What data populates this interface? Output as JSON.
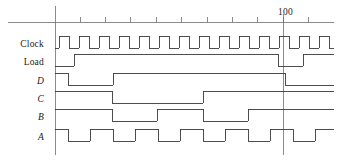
{
  "figure": {
    "kind": "digital-timing-diagram",
    "width": 338,
    "height": 161,
    "background": "#ffffff",
    "line_color": "#3a3a3a",
    "axis_color": "#6e6e6e",
    "text_color": "#1a1a1a"
  },
  "axis": {
    "baseline_y": 22,
    "origin_x": 55,
    "vertical_axis_top": 6,
    "vertical_axis_bottom": 155,
    "axis_start_x": 8,
    "axis_end_x": 334,
    "tick_spacing": 25.4,
    "tick_height": 5,
    "tick_start_x": 80,
    "tick_count": 10
  },
  "markers": [
    {
      "name": "time-marker-100",
      "label": "100",
      "x": 283,
      "label_x": 278,
      "label_y": 8,
      "top_y": 14,
      "bottom_y": 155
    }
  ],
  "signals": [
    {
      "name": "clock",
      "label": "Clock",
      "italic": false,
      "label_x": 44,
      "label_y": 40,
      "low_y": 48,
      "high_y": 36,
      "start_x": 55,
      "end_x": 334,
      "initial": 0,
      "transitions": [
        59,
        69,
        79,
        89,
        99,
        109,
        119,
        129,
        139,
        149,
        159,
        169,
        179,
        189,
        199,
        209,
        219,
        229,
        239,
        249,
        259,
        269,
        279,
        289,
        299,
        309,
        319,
        329
      ]
    },
    {
      "name": "load",
      "label": "Load",
      "italic": false,
      "label_x": 44,
      "label_y": 58,
      "low_y": 66,
      "high_y": 54,
      "start_x": 55,
      "end_x": 334,
      "initial": 0,
      "transitions": [
        74,
        278,
        303
      ]
    },
    {
      "name": "d",
      "label": "D",
      "italic": true,
      "label_x": 44,
      "label_y": 77,
      "low_y": 85,
      "high_y": 73,
      "start_x": 55,
      "end_x": 334,
      "initial": 1,
      "transitions": [
        68,
        113,
        285
      ]
    },
    {
      "name": "c",
      "label": "C",
      "italic": true,
      "label_x": 44,
      "label_y": 95,
      "low_y": 103,
      "high_y": 91,
      "start_x": 55,
      "end_x": 334,
      "initial": 1,
      "transitions": [
        112,
        203
      ]
    },
    {
      "name": "b",
      "label": "B",
      "italic": true,
      "label_x": 44,
      "label_y": 113,
      "low_y": 121,
      "high_y": 109,
      "start_x": 55,
      "end_x": 334,
      "initial": 1,
      "transitions": [
        112,
        157,
        203,
        248
      ]
    },
    {
      "name": "a",
      "label": "A",
      "italic": true,
      "label_x": 44,
      "label_y": 133,
      "low_y": 141,
      "high_y": 129,
      "start_x": 55,
      "end_x": 334,
      "initial": 1,
      "transitions": [
        68,
        90,
        113,
        135,
        158,
        180,
        203,
        225,
        248,
        270,
        293,
        315
      ]
    }
  ],
  "chart_data": {
    "type": "line",
    "title": "",
    "xlabel": "",
    "ylabel": "",
    "series": [
      {
        "name": "Clock",
        "kind": "square-wave",
        "period_px": 20,
        "initial_level": 0
      },
      {
        "name": "Load",
        "kind": "digital",
        "initial_level": 0
      },
      {
        "name": "D",
        "kind": "digital",
        "initial_level": 1
      },
      {
        "name": "C",
        "kind": "digital",
        "initial_level": 1
      },
      {
        "name": "B",
        "kind": "digital",
        "initial_level": 1
      },
      {
        "name": "A",
        "kind": "digital",
        "initial_level": 1
      }
    ],
    "annotations": [
      "100"
    ]
  }
}
